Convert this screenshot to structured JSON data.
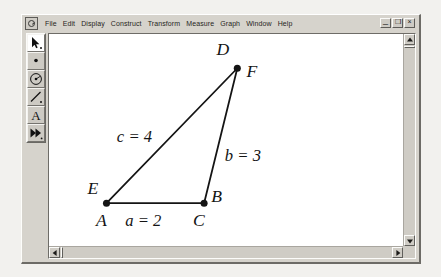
{
  "window": {
    "app_icon": "sketchpad-icon",
    "menu": [
      "File",
      "Edit",
      "Display",
      "Construct",
      "Transform",
      "Measure",
      "Graph",
      "Window",
      "Help"
    ],
    "controls": {
      "minimize": "_",
      "restore": "❐",
      "close": "×"
    }
  },
  "toolbox": {
    "tools": [
      {
        "name": "selection-arrow-tool",
        "active": true
      },
      {
        "name": "point-tool",
        "active": false
      },
      {
        "name": "compass-circle-tool",
        "active": false
      },
      {
        "name": "straightedge-segment-tool",
        "active": false
      },
      {
        "name": "text-label-tool",
        "active": false
      },
      {
        "name": "custom-transform-tool",
        "active": false
      }
    ]
  },
  "sketch": {
    "vertices": [
      {
        "id": "top",
        "x": 278,
        "y": 73,
        "labels": [
          {
            "text": "D",
            "x": 264,
            "y": 60
          },
          {
            "text": "F",
            "x": 292,
            "y": 81
          }
        ]
      },
      {
        "id": "bottom-left",
        "x": 152,
        "y": 203,
        "labels": [
          {
            "text": "E",
            "x": 139,
            "y": 194
          },
          {
            "text": "A",
            "x": 145,
            "y": 224
          }
        ]
      },
      {
        "id": "bottom-right",
        "x": 246,
        "y": 203,
        "labels": [
          {
            "text": "B",
            "x": 256,
            "y": 201
          },
          {
            "text": "C",
            "x": 239,
            "y": 224
          }
        ]
      }
    ],
    "segments": [
      {
        "name": "segment-a",
        "from": "bottom-left",
        "to": "bottom-right"
      },
      {
        "name": "segment-b",
        "from": "bottom-right",
        "to": "top"
      },
      {
        "name": "segment-c",
        "from": "bottom-left",
        "to": "top"
      }
    ],
    "measurements": [
      {
        "name": "measure-c",
        "text": "c = 4",
        "x": 162,
        "y": 144
      },
      {
        "name": "measure-b",
        "text": "b = 3",
        "x": 268,
        "y": 162
      },
      {
        "name": "measure-a",
        "text": "a = 2",
        "x": 173,
        "y": 224
      }
    ],
    "stroke_color": "#141414",
    "background": "#ffffff"
  },
  "scrollbars": {
    "vertical": {
      "up": "▲",
      "down": "▼"
    },
    "horizontal": {
      "left": "◀",
      "right": "▶"
    }
  }
}
